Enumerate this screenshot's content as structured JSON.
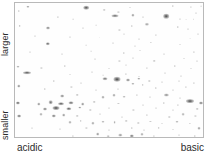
{
  "figure": {
    "type": "2d-gel-electrophoresis",
    "background_color": "#fefefe",
    "border_color": "#b9b9b9",
    "spot_color": "#4a4a4a"
  },
  "axes": {
    "y_top_label": "larger",
    "y_bottom_label": "smaller",
    "x_left_label": "acidic",
    "x_right_label": "basic"
  },
  "spots": [
    [
      7.0,
      3.0,
      3.2,
      2.4,
      0.55
    ],
    [
      2.0,
      6.0,
      2.4,
      2.0,
      0.3
    ],
    [
      38.0,
      3.5,
      5.6,
      4.6,
      0.82
    ],
    [
      47.5,
      5.0,
      2.6,
      2.2,
      0.34
    ],
    [
      55.0,
      6.5,
      2.2,
      1.8,
      0.26
    ],
    [
      61.0,
      3.5,
      2.0,
      1.8,
      0.22
    ],
    [
      84.0,
      2.0,
      2.4,
      2.0,
      0.3
    ],
    [
      93.5,
      3.0,
      2.2,
      1.8,
      0.24
    ],
    [
      99.0,
      2.2,
      1.8,
      1.6,
      0.2
    ],
    [
      23.0,
      10.5,
      2.2,
      1.9,
      0.28
    ],
    [
      31.0,
      12.0,
      1.8,
      1.6,
      0.2
    ],
    [
      53.0,
      9.5,
      7.0,
      3.4,
      0.7
    ],
    [
      62.5,
      9.0,
      3.2,
      2.6,
      0.52
    ],
    [
      68.0,
      10.5,
      2.0,
      1.8,
      0.24
    ],
    [
      80.5,
      10.0,
      5.6,
      4.6,
      0.86
    ],
    [
      87.5,
      12.0,
      2.0,
      1.8,
      0.22
    ],
    [
      91.0,
      12.5,
      1.8,
      1.6,
      0.2
    ],
    [
      95.0,
      12.2,
      1.8,
      1.6,
      0.2
    ],
    [
      96.5,
      7.5,
      2.0,
      1.8,
      0.22
    ],
    [
      2.5,
      17.0,
      2.6,
      2.2,
      0.4
    ],
    [
      17.5,
      18.5,
      4.0,
      3.2,
      0.62
    ],
    [
      36.0,
      19.0,
      2.0,
      1.8,
      0.22
    ],
    [
      43.0,
      16.5,
      1.8,
      1.6,
      0.18
    ],
    [
      55.5,
      20.0,
      2.2,
      1.9,
      0.26
    ],
    [
      62.0,
      17.5,
      2.4,
      2.0,
      0.3
    ],
    [
      70.0,
      16.0,
      4.2,
      2.4,
      0.46
    ],
    [
      86.5,
      18.0,
      2.4,
      2.0,
      0.34
    ],
    [
      92.0,
      19.5,
      2.0,
      1.8,
      0.22
    ],
    [
      10.5,
      24.5,
      2.0,
      1.8,
      0.22
    ],
    [
      29.0,
      25.5,
      2.0,
      1.8,
      0.22
    ],
    [
      45.0,
      26.0,
      1.8,
      1.6,
      0.18
    ],
    [
      58.0,
      23.0,
      2.0,
      1.8,
      0.2
    ],
    [
      66.0,
      27.0,
      2.0,
      1.8,
      0.22
    ],
    [
      75.0,
      24.0,
      2.2,
      1.9,
      0.24
    ],
    [
      93.0,
      26.5,
      1.8,
      1.6,
      0.18
    ],
    [
      97.5,
      23.5,
      2.0,
      1.8,
      0.22
    ],
    [
      17.5,
      30.5,
      4.4,
      3.6,
      0.72
    ],
    [
      38.0,
      31.5,
      1.8,
      1.6,
      0.18
    ],
    [
      52.0,
      30.0,
      2.0,
      1.8,
      0.22
    ],
    [
      64.0,
      32.0,
      2.0,
      1.8,
      0.2
    ],
    [
      72.5,
      29.5,
      2.2,
      1.9,
      0.26
    ],
    [
      88.0,
      31.0,
      2.0,
      1.8,
      0.22
    ],
    [
      8.0,
      36.5,
      2.0,
      1.8,
      0.22
    ],
    [
      25.0,
      38.0,
      2.0,
      1.8,
      0.22
    ],
    [
      40.5,
      36.0,
      1.8,
      1.6,
      0.18
    ],
    [
      58.0,
      37.5,
      2.4,
      2.0,
      0.3
    ],
    [
      66.5,
      35.5,
      2.0,
      1.8,
      0.22
    ],
    [
      79.5,
      38.0,
      2.0,
      1.8,
      0.22
    ],
    [
      95.0,
      36.5,
      2.2,
      1.9,
      0.26
    ],
    [
      42.5,
      42.0,
      2.0,
      1.8,
      0.22
    ],
    [
      55.5,
      43.5,
      2.2,
      1.9,
      0.26
    ],
    [
      63.0,
      41.0,
      2.0,
      1.8,
      0.22
    ],
    [
      74.0,
      43.0,
      2.6,
      2.2,
      0.34
    ],
    [
      90.0,
      41.5,
      2.0,
      1.8,
      0.22
    ],
    [
      97.0,
      43.5,
      2.0,
      1.8,
      0.22
    ],
    [
      1.5,
      47.5,
      3.0,
      2.6,
      0.46
    ],
    [
      14.0,
      48.5,
      2.2,
      1.9,
      0.26
    ],
    [
      26.5,
      47.0,
      2.4,
      2.0,
      0.3
    ],
    [
      50.0,
      49.0,
      2.0,
      1.8,
      0.22
    ],
    [
      59.0,
      46.5,
      2.0,
      1.8,
      0.2
    ],
    [
      70.0,
      48.5,
      2.2,
      1.9,
      0.24
    ],
    [
      85.0,
      47.0,
      2.4,
      2.0,
      0.3
    ],
    [
      93.5,
      49.0,
      2.0,
      1.8,
      0.22
    ],
    [
      6.5,
      52.0,
      8.0,
      3.6,
      0.78
    ],
    [
      29.0,
      53.5,
      2.0,
      1.8,
      0.22
    ],
    [
      41.0,
      51.5,
      2.0,
      1.8,
      0.22
    ],
    [
      47.0,
      54.0,
      1.8,
      1.6,
      0.18
    ],
    [
      59.0,
      53.0,
      2.2,
      1.9,
      0.26
    ],
    [
      66.0,
      55.0,
      2.0,
      1.8,
      0.22
    ],
    [
      80.0,
      52.5,
      2.0,
      1.8,
      0.22
    ],
    [
      88.5,
      54.5,
      2.0,
      1.8,
      0.22
    ],
    [
      20.5,
      58.0,
      2.4,
      2.0,
      0.32
    ],
    [
      35.0,
      59.5,
      2.0,
      1.8,
      0.22
    ],
    [
      48.0,
      56.5,
      5.0,
      3.6,
      0.66
    ],
    [
      54.5,
      57.0,
      7.0,
      4.4,
      0.88
    ],
    [
      60.0,
      57.5,
      4.0,
      3.0,
      0.62
    ],
    [
      66.0,
      56.5,
      3.4,
      2.6,
      0.5
    ],
    [
      71.5,
      58.0,
      2.4,
      2.0,
      0.32
    ],
    [
      78.0,
      59.0,
      2.0,
      1.8,
      0.22
    ],
    [
      62.5,
      60.5,
      3.2,
      2.4,
      0.48
    ],
    [
      68.0,
      61.0,
      2.6,
      2.2,
      0.34
    ],
    [
      87.0,
      58.5,
      2.0,
      1.8,
      0.22
    ],
    [
      95.0,
      60.0,
      2.2,
      1.9,
      0.26
    ],
    [
      2.0,
      62.0,
      3.4,
      2.8,
      0.58
    ],
    [
      16.0,
      64.0,
      2.4,
      2.0,
      0.3
    ],
    [
      30.0,
      63.0,
      2.2,
      1.9,
      0.26
    ],
    [
      43.0,
      65.0,
      2.0,
      1.8,
      0.22
    ],
    [
      55.0,
      64.5,
      2.0,
      1.8,
      0.22
    ],
    [
      75.0,
      63.5,
      2.4,
      2.0,
      0.3
    ],
    [
      84.0,
      65.0,
      2.0,
      1.8,
      0.22
    ],
    [
      91.0,
      63.0,
      2.2,
      1.9,
      0.26
    ],
    [
      25.0,
      69.5,
      3.6,
      3.0,
      0.6
    ],
    [
      33.0,
      68.5,
      2.6,
      2.2,
      0.36
    ],
    [
      47.0,
      70.5,
      3.0,
      2.6,
      0.48
    ],
    [
      52.5,
      69.0,
      3.0,
      2.6,
      0.48
    ],
    [
      58.0,
      70.0,
      2.8,
      2.4,
      0.42
    ],
    [
      65.0,
      68.5,
      2.2,
      1.9,
      0.26
    ],
    [
      72.0,
      70.5,
      2.0,
      1.8,
      0.22
    ],
    [
      80.5,
      69.0,
      4.2,
      3.0,
      0.56
    ],
    [
      88.0,
      71.0,
      2.0,
      1.8,
      0.22
    ],
    [
      1.5,
      74.5,
      4.2,
      3.2,
      0.76
    ],
    [
      12.5,
      75.5,
      3.4,
      2.8,
      0.56
    ],
    [
      19.0,
      74.0,
      4.6,
      3.4,
      0.7
    ],
    [
      24.5,
      75.0,
      6.0,
      3.6,
      0.78
    ],
    [
      30.0,
      74.5,
      5.0,
      3.4,
      0.72
    ],
    [
      36.0,
      75.5,
      3.6,
      2.8,
      0.56
    ],
    [
      42.0,
      74.0,
      2.6,
      2.2,
      0.36
    ],
    [
      55.0,
      75.0,
      2.2,
      1.9,
      0.26
    ],
    [
      68.0,
      76.0,
      2.0,
      1.8,
      0.22
    ],
    [
      79.0,
      74.5,
      2.4,
      2.0,
      0.3
    ],
    [
      86.5,
      76.0,
      2.2,
      1.9,
      0.26
    ],
    [
      93.0,
      73.5,
      8.0,
      3.8,
      0.84
    ],
    [
      99.0,
      74.5,
      4.0,
      3.0,
      0.66
    ],
    [
      16.0,
      79.0,
      4.0,
      3.0,
      0.64
    ],
    [
      22.0,
      78.0,
      7.0,
      4.0,
      0.86
    ],
    [
      28.5,
      79.0,
      5.4,
      3.6,
      0.76
    ],
    [
      34.5,
      78.0,
      3.4,
      2.8,
      0.52
    ],
    [
      40.0,
      79.5,
      2.4,
      2.0,
      0.3
    ],
    [
      50.0,
      78.5,
      2.0,
      1.8,
      0.22
    ],
    [
      63.0,
      80.0,
      2.2,
      1.9,
      0.26
    ],
    [
      75.0,
      78.5,
      2.0,
      1.8,
      0.22
    ],
    [
      84.0,
      80.0,
      2.0,
      1.8,
      0.22
    ],
    [
      97.0,
      79.0,
      2.6,
      2.2,
      0.36
    ],
    [
      2.0,
      84.0,
      3.8,
      3.0,
      0.7
    ],
    [
      14.0,
      83.0,
      3.0,
      2.4,
      0.44
    ],
    [
      20.5,
      84.5,
      4.4,
      3.2,
      0.66
    ],
    [
      26.0,
      83.5,
      3.6,
      2.8,
      0.54
    ],
    [
      33.0,
      84.5,
      2.6,
      2.2,
      0.34
    ],
    [
      45.0,
      83.0,
      2.0,
      1.8,
      0.22
    ],
    [
      57.0,
      85.0,
      2.0,
      1.8,
      0.22
    ],
    [
      70.0,
      83.5,
      2.2,
      1.9,
      0.26
    ],
    [
      82.0,
      85.0,
      2.4,
      2.0,
      0.3
    ],
    [
      89.5,
      83.0,
      2.8,
      2.4,
      0.4
    ],
    [
      96.0,
      84.5,
      2.2,
      1.9,
      0.26
    ],
    [
      29.0,
      89.0,
      3.0,
      2.4,
      0.44
    ],
    [
      35.0,
      88.0,
      2.6,
      2.2,
      0.34
    ],
    [
      41.5,
      89.5,
      3.2,
      2.6,
      0.46
    ],
    [
      47.0,
      88.5,
      3.0,
      2.4,
      0.44
    ],
    [
      53.0,
      89.0,
      2.8,
      2.4,
      0.4
    ],
    [
      59.0,
      88.0,
      2.6,
      2.2,
      0.34
    ],
    [
      65.5,
      89.5,
      2.4,
      2.0,
      0.3
    ],
    [
      72.0,
      88.5,
      2.2,
      1.9,
      0.26
    ],
    [
      78.0,
      90.0,
      2.0,
      1.8,
      0.22
    ],
    [
      86.0,
      88.5,
      3.0,
      2.4,
      0.44
    ],
    [
      93.0,
      90.0,
      2.2,
      1.9,
      0.26
    ],
    [
      9.0,
      93.5,
      2.0,
      1.8,
      0.22
    ],
    [
      24.0,
      94.0,
      2.0,
      1.8,
      0.22
    ],
    [
      38.0,
      93.0,
      2.2,
      1.9,
      0.26
    ],
    [
      50.0,
      95.0,
      2.0,
      1.8,
      0.22
    ],
    [
      62.0,
      93.5,
      2.4,
      2.0,
      0.3
    ],
    [
      68.5,
      95.0,
      2.0,
      1.8,
      0.22
    ],
    [
      76.5,
      93.0,
      2.6,
      2.2,
      0.34
    ],
    [
      84.0,
      94.5,
      2.0,
      1.8,
      0.22
    ],
    [
      98.0,
      93.5,
      3.0,
      2.4,
      0.5
    ],
    [
      31.0,
      99.0,
      2.2,
      1.9,
      0.26
    ],
    [
      44.0,
      98.0,
      3.6,
      2.8,
      0.54
    ],
    [
      49.5,
      99.5,
      2.6,
      2.2,
      0.34
    ],
    [
      56.0,
      98.5,
      3.4,
      2.8,
      0.52
    ],
    [
      62.0,
      99.0,
      4.4,
      3.2,
      0.68
    ],
    [
      67.5,
      98.0,
      3.0,
      2.4,
      0.44
    ],
    [
      74.0,
      99.5,
      2.2,
      1.9,
      0.26
    ],
    [
      87.0,
      98.5,
      2.0,
      1.8,
      0.22
    ],
    [
      95.5,
      99.5,
      2.4,
      2.0,
      0.3
    ],
    [
      19.0,
      104.0,
      2.0,
      1.8,
      0.22
    ],
    [
      27.5,
      103.0,
      2.4,
      2.0,
      0.3
    ],
    [
      42.0,
      104.5,
      2.6,
      2.2,
      0.34
    ],
    [
      48.0,
      103.5,
      2.2,
      1.9,
      0.26
    ],
    [
      58.0,
      104.0,
      2.0,
      1.8,
      0.22
    ],
    [
      70.0,
      103.0,
      2.4,
      2.0,
      0.3
    ],
    [
      81.0,
      104.5,
      2.0,
      1.8,
      0.22
    ],
    [
      91.0,
      103.5,
      2.2,
      1.9,
      0.26
    ],
    [
      98.5,
      105.0,
      3.4,
      2.8,
      0.56
    ],
    [
      22.0,
      109.0,
      3.2,
      2.4,
      0.46
    ],
    [
      26.5,
      110.0,
      2.6,
      2.2,
      0.34
    ],
    [
      33.0,
      108.5,
      2.0,
      1.8,
      0.22
    ],
    [
      45.0,
      110.0,
      2.0,
      1.8,
      0.22
    ],
    [
      54.0,
      109.0,
      2.2,
      1.9,
      0.26
    ],
    [
      66.0,
      110.5,
      2.0,
      1.8,
      0.22
    ],
    [
      77.0,
      109.0,
      2.4,
      2.0,
      0.3
    ],
    [
      88.0,
      110.0,
      2.0,
      1.8,
      0.22
    ],
    [
      15.0,
      115.0,
      2.4,
      2.0,
      0.3
    ],
    [
      19.5,
      114.0,
      2.6,
      2.2,
      0.34
    ],
    [
      24.0,
      115.5,
      2.2,
      1.9,
      0.26
    ],
    [
      37.0,
      114.5,
      2.0,
      1.8,
      0.22
    ],
    [
      51.0,
      116.0,
      2.2,
      1.9,
      0.26
    ],
    [
      63.0,
      114.5,
      2.0,
      1.8,
      0.22
    ],
    [
      73.0,
      115.5,
      2.4,
      2.0,
      0.3
    ],
    [
      85.0,
      114.0,
      2.0,
      1.8,
      0.22
    ],
    [
      94.0,
      116.0,
      2.0,
      1.8,
      0.22
    ],
    [
      46.0,
      120.0,
      3.0,
      2.6,
      0.48
    ],
    [
      46.5,
      123.5,
      3.4,
      2.8,
      0.56
    ],
    [
      61.0,
      121.0,
      3.6,
      3.0,
      0.58
    ],
    [
      61.5,
      124.5,
      3.0,
      2.4,
      0.44
    ],
    [
      72.0,
      122.0,
      2.0,
      1.8,
      0.22
    ],
    [
      80.0,
      120.5,
      2.6,
      2.2,
      0.36
    ],
    [
      80.5,
      124.0,
      2.4,
      2.0,
      0.3
    ],
    [
      30.0,
      121.5,
      2.0,
      1.8,
      0.22
    ],
    [
      90.0,
      122.5,
      2.0,
      1.8,
      0.22
    ],
    [
      3.0,
      130.5,
      4.0,
      2.4,
      0.5
    ],
    [
      7.5,
      131.0,
      2.6,
      2.0,
      0.34
    ],
    [
      26.0,
      129.5,
      2.0,
      1.8,
      0.22
    ],
    [
      45.0,
      130.5,
      2.2,
      1.9,
      0.26
    ],
    [
      48.0,
      128.5,
      1.8,
      1.6,
      0.18
    ],
    [
      66.0,
      129.5,
      2.0,
      1.8,
      0.22
    ],
    [
      69.0,
      131.0,
      1.8,
      1.6,
      0.18
    ],
    [
      83.0,
      130.0,
      2.4,
      2.0,
      0.32
    ]
  ]
}
